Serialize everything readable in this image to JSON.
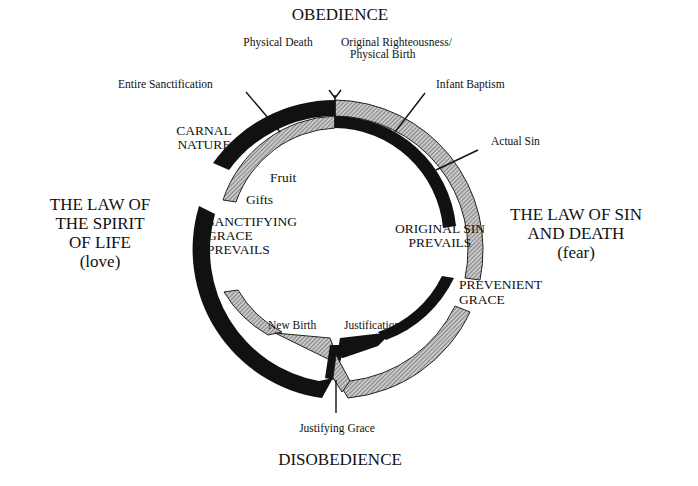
{
  "diagram": {
    "top_label": "OBEDIENCE",
    "bottom_label": "DISOBEDIENCE",
    "left_law": {
      "lines": [
        "THE LAW OF",
        "THE SPIRIT",
        "OF LIFE",
        "(love)"
      ]
    },
    "right_law": {
      "lines": [
        "THE LAW OF SIN",
        "AND DEATH",
        "(fear)"
      ]
    },
    "markers": {
      "physical_death": "Physical Death",
      "original_righteousness": [
        "Original Righteousness/",
        "Physical Birth"
      ],
      "entire_sanctification": "Entire Sanctification",
      "infant_baptism": "Infant Baptism",
      "actual_sin": "Actual Sin",
      "new_birth": "New Birth",
      "justification": "Justification",
      "justifying_grace": "Justifying Grace"
    },
    "regions": {
      "carnal_nature": [
        "CARNAL",
        "NATURE"
      ],
      "fruit": "Fruit",
      "gifts": "Gifts",
      "sanctifying_grace": [
        "SANCTIFYING",
        "GRACE",
        "PREVAILS"
      ],
      "original_sin": [
        "ORIGINAL SIN",
        "PREVAILS"
      ],
      "prevenient_grace": [
        "PREVENIENT",
        "GRACE"
      ]
    },
    "colors": {
      "solid_band": "#111111",
      "hatched_band": "#9a9a9a",
      "background": "#ffffff"
    }
  }
}
